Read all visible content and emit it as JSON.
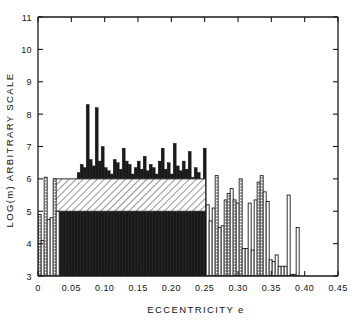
{
  "chart_data": {
    "type": "bar",
    "title": "",
    "xlabel": "ECCENTRICITY e",
    "ylabel": "LOG(m) ARBITRARY SCALE",
    "xlim": [
      0.0,
      0.45
    ],
    "ylim": [
      3,
      11
    ],
    "xticks": [
      "0",
      "0.05",
      "0.10",
      "0.15",
      "0.20",
      "0.25",
      "0.30",
      "0.35",
      "0.40",
      "0.45"
    ],
    "xtick_values": [
      0,
      0.05,
      0.1,
      0.15,
      0.2,
      0.25,
      0.3,
      0.35,
      0.4,
      0.45
    ],
    "yticks": [
      "3",
      "4",
      "5",
      "6",
      "7",
      "8",
      "9",
      "10",
      "11"
    ],
    "ytick_values": [
      3,
      4,
      5,
      6,
      7,
      8,
      9,
      10,
      11
    ],
    "grid": false,
    "legend": "none",
    "bin_width": 0.0045,
    "baseline": 3,
    "hatch_band": {
      "note": "diagonal-hatched block",
      "x0": 0.0235,
      "x1": 0.2515,
      "y0": 5.0,
      "y1": 6.0
    },
    "series": [
      {
        "name": "counts",
        "x": [
          0.0025,
          0.007,
          0.0115,
          0.016,
          0.0205,
          0.025,
          0.0295,
          0.034,
          0.0385,
          0.043,
          0.0475,
          0.052,
          0.0565,
          0.061,
          0.0655,
          0.07,
          0.0745,
          0.079,
          0.0835,
          0.088,
          0.0925,
          0.097,
          0.1015,
          0.106,
          0.1105,
          0.115,
          0.1195,
          0.124,
          0.1285,
          0.133,
          0.1375,
          0.142,
          0.1465,
          0.151,
          0.1555,
          0.16,
          0.1645,
          0.169,
          0.1735,
          0.178,
          0.1825,
          0.187,
          0.1915,
          0.196,
          0.2005,
          0.205,
          0.2095,
          0.214,
          0.2185,
          0.223,
          0.2275,
          0.232,
          0.2365,
          0.241,
          0.2455,
          0.25,
          0.2545,
          0.259,
          0.2635,
          0.268,
          0.2725,
          0.277,
          0.2815,
          0.286,
          0.2905,
          0.295,
          0.2995,
          0.304,
          0.3085,
          0.313,
          0.3175,
          0.322,
          0.3265,
          0.331,
          0.3355,
          0.34,
          0.3445,
          0.349,
          0.3535,
          0.358,
          0.3625,
          0.367,
          0.3715,
          0.376,
          0.3805,
          0.385,
          0.3895
        ],
        "values": [
          4.9,
          4.1,
          6.05,
          4.75,
          4.8,
          6.0,
          5.0,
          5.75,
          5.85,
          5.9,
          5.95,
          5.7,
          5.75,
          6.2,
          6.45,
          6.35,
          8.3,
          6.6,
          6.4,
          8.2,
          6.55,
          7.0,
          6.35,
          6.25,
          6.15,
          6.6,
          6.5,
          6.3,
          6.95,
          6.55,
          6.45,
          6.15,
          6.35,
          6.55,
          6.3,
          6.7,
          6.25,
          6.45,
          6.35,
          6.15,
          6.55,
          6.95,
          6.3,
          6.5,
          6.15,
          7.1,
          6.4,
          6.25,
          6.55,
          6.3,
          6.85,
          6.05,
          6.35,
          6.2,
          5.8,
          6.95,
          5.2,
          4.7,
          5.1,
          6.1,
          4.5,
          4.55,
          5.35,
          5.55,
          5.7,
          5.35,
          5.25,
          6.0,
          3.85,
          3.85,
          5.25,
          3.8,
          5.35,
          5.9,
          6.1,
          5.6,
          5.3,
          3.5,
          3.45,
          3.65,
          3.3,
          3.3,
          3.3,
          5.5,
          3.05,
          3.05,
          4.5
        ],
        "fill": [
          "dot",
          "outline",
          "dot",
          "outline",
          "outline",
          "dot",
          "outline",
          "black",
          "black",
          "black",
          "black",
          "black",
          "black",
          "black",
          "black",
          "black",
          "black",
          "black",
          "black",
          "black",
          "black",
          "black",
          "black",
          "black",
          "black",
          "black",
          "black",
          "black",
          "black",
          "black",
          "black",
          "black",
          "black",
          "black",
          "black",
          "black",
          "black",
          "black",
          "black",
          "black",
          "black",
          "black",
          "black",
          "black",
          "black",
          "black",
          "black",
          "black",
          "black",
          "black",
          "black",
          "black",
          "black",
          "black",
          "black",
          "black",
          "outline",
          "outline",
          "outline",
          "dot",
          "outline",
          "outline",
          "dot",
          "dot",
          "outline",
          "dot",
          "outline",
          "dot",
          "outline",
          "outline",
          "outline",
          "outline",
          "outline",
          "dot",
          "dot",
          "outline",
          "outline",
          "outline",
          "outline",
          "outline",
          "outline",
          "outline",
          "outline",
          "outline",
          "outline",
          "outline",
          "outline"
        ]
      }
    ]
  },
  "axis": {
    "y_label": "LOG(m) ARBITRARY SCALE",
    "x_label": "ECCENTRICITY e"
  }
}
